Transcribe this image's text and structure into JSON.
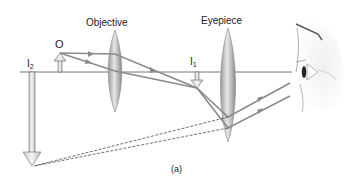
{
  "diagram": {
    "labels": {
      "objective": "Objective",
      "eyepiece": "Eyepiece",
      "object": "O",
      "image1_main": "I",
      "image1_sub": "1",
      "image2_main": "I",
      "image2_sub": "2",
      "caption": "(a)"
    },
    "components": [
      {
        "name": "object arrow O",
        "x": 60,
        "direction": "up"
      },
      {
        "name": "objective lens",
        "x": 115
      },
      {
        "name": "intermediate image I1",
        "x": 197,
        "direction": "down"
      },
      {
        "name": "eyepiece lens",
        "x": 228
      },
      {
        "name": "final virtual image I2",
        "x": 32,
        "direction": "down"
      },
      {
        "name": "eye",
        "x": 300
      }
    ],
    "colors": {
      "ray": "#8a8a8a",
      "lens": "#b8b8b8",
      "axis": "#555555",
      "text": "#222222"
    }
  }
}
